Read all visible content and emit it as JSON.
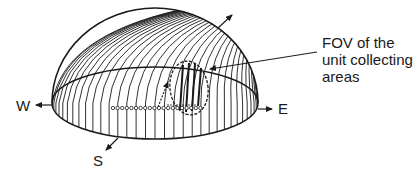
{
  "figure": {
    "type": "hemisphere-sky-dome",
    "annotation": {
      "lines": [
        "FOV of the",
        "unit collecting",
        "areas"
      ]
    },
    "directions": {
      "west": "W",
      "east": "E",
      "south": "S"
    },
    "colors": {
      "line": "#1a1a1a",
      "background": "#ffffff"
    },
    "collecting_areas_count": 20,
    "meridian_count": 34
  }
}
